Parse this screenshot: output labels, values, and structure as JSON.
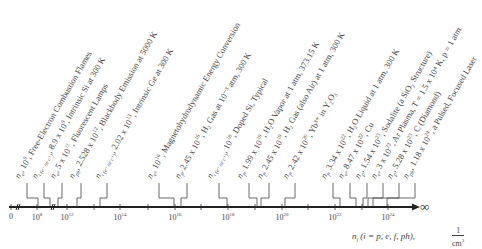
{
  "diagram": {
    "axis": {
      "title": "n",
      "title_sub": "i",
      "title_rest": " (i = p, e, f, ph),",
      "unit_num": "1",
      "unit_den": "cm",
      "unit_den_sup": "3",
      "infinity": "∞",
      "ticks": [
        {
          "base": "0",
          "exp": "",
          "x": 11
        },
        {
          "base": "10",
          "exp": "8",
          "x": 37
        },
        {
          "base": "10",
          "exp": "12",
          "x": 67
        },
        {
          "base": "10",
          "exp": "14",
          "x": 120
        },
        {
          "base": "10",
          "exp": "16",
          "x": 175
        },
        {
          "base": "10",
          "exp": "18",
          "x": 228
        },
        {
          "base": "10",
          "exp": "20",
          "x": 282
        },
        {
          "base": "10",
          "exp": "22",
          "x": 335
        },
        {
          "base": "10",
          "exp": "24",
          "x": 388
        }
      ]
    },
    "labels": [
      {
        "sym": "n",
        "sub": "e",
        "val": ", 10",
        "exp": "9",
        "desc": ", Free-Electron Combustion Flames",
        "lx": 27,
        "ax": 38
      },
      {
        "sym": "n",
        "sub": "i (e⁻ or c⁺)",
        "val": ", 8.9 x 10",
        "exp": "9",
        "desc": ", Intrinsic Si at 300 K",
        "lx": 44,
        "ax": 50
      },
      {
        "sym": "n",
        "sub": "e",
        "val": ", 5 x 10",
        "exp": "11",
        "desc": ", Fluorescent Lamps",
        "lx": 62,
        "ax": 58
      },
      {
        "sym": "n",
        "sub": "ph",
        "val": ", 2.528 x 10",
        "exp": "12",
        "desc": ", Blackbody Emission at 5000 K",
        "lx": 81,
        "ax": 77
      },
      {
        "sym": "n",
        "sub": "i (e⁻ or c⁺)",
        "val": ", 2.02 x 10",
        "exp": "13",
        "desc": ", Intrinsic Ge at 300 K",
        "lx": 107,
        "ax": 100
      },
      {
        "sym": "n",
        "sub": "e",
        "val": ", 10",
        "exp": "16",
        "desc": ", Magnetohydrodynamic Energy Conversion",
        "lx": 159,
        "ax": 174
      },
      {
        "sym": "n",
        "sub": "f",
        "val": ", 2.45 x 10",
        "exp": "16",
        "desc": ", H₂ Gas at 10⁻³ atm, 300 K",
        "lx": 187,
        "ax": 181
      },
      {
        "sym": "n",
        "sub": "i (e⁻ or c⁺)",
        "val": ", 10",
        "exp": "18",
        "desc": ", Doped Si, Typical",
        "lx": 219,
        "ax": 227
      },
      {
        "sym": "n",
        "sub": "f",
        "val": ", 1.99 x 10",
        "exp": "19",
        "desc": ", H₂O Vapor at 1 atm, 373.15 K",
        "lx": 249,
        "ax": 257
      },
      {
        "sym": "n",
        "sub": "f",
        "val": ", 2.45 x 10",
        "exp": "19",
        "desc": ", H₂ Gas (also Air) at 1 atm, 300 K",
        "lx": 269,
        "ax": 261
      },
      {
        "sym": "n",
        "sub": "f",
        "val": ", 2.42 x 10",
        "exp": "20",
        "desc": ", Yb³⁺ in Y₂O₃",
        "lx": 295,
        "ax": 285
      },
      {
        "sym": "n",
        "sub": "f",
        "val": ", 3.34 x 10",
        "exp": "22",
        "desc": ", H₂O Liquid at 1 atm, 300 K",
        "lx": 333,
        "ax": 340
      },
      {
        "sym": "n",
        "sub": "e",
        "val": ", 8.47 x 10",
        "exp": "22",
        "desc": ", Cu",
        "lx": 350,
        "ax": 356
      },
      {
        "sym": "n",
        "sub": "p",
        "val": ", 1.54 x 10",
        "exp": "23",
        "desc": ", Sodalite (a SiO₂ Structure)",
        "lx": 367,
        "ax": 363
      },
      {
        "sym": "n",
        "sub": "e",
        "val": ", 3 x 10",
        "exp": "23",
        "desc": ", Ar Plasma, T = 1.5 x 10⁴ K, p = 1 atm",
        "lx": 383,
        "ax": 368
      },
      {
        "sym": "n",
        "sub": "p",
        "val": ", 5.28 x 10",
        "exp": "23",
        "desc": ", C (Diamond)",
        "lx": 399,
        "ax": 373
      },
      {
        "sym": "n",
        "sub": "ph",
        "val": ", 1.18 x 10",
        "exp": "24",
        "desc": ", a Pulsed, Focused Laser",
        "lx": 415,
        "ax": 387
      }
    ]
  }
}
